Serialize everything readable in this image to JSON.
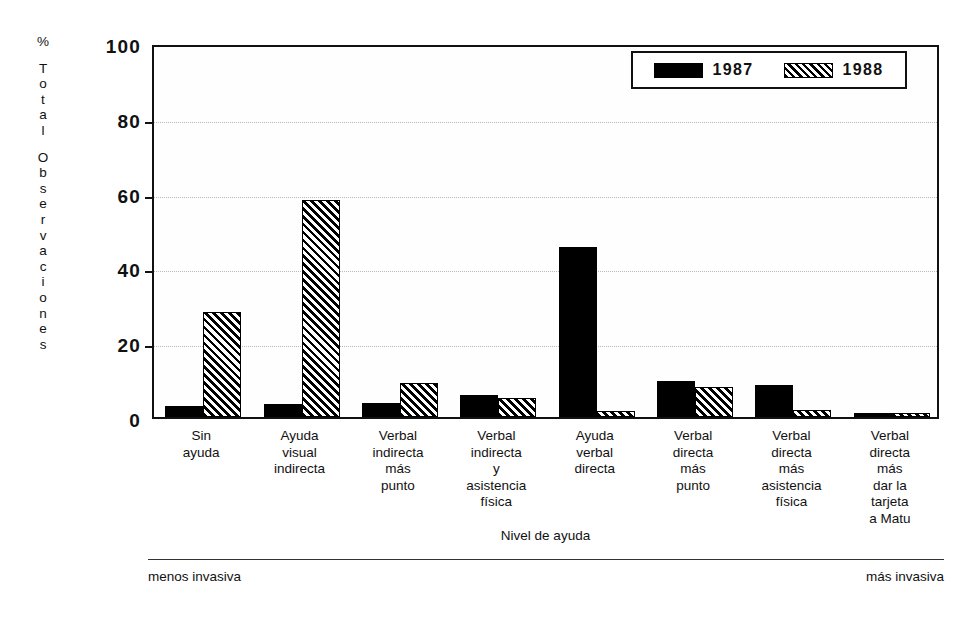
{
  "chart_data": {
    "type": "bar",
    "title": "",
    "xlabel": "Nivel de ayuda",
    "ylabel": "% Total Observaciones",
    "ylim": [
      0,
      100
    ],
    "yticks": [
      0,
      20,
      40,
      60,
      80,
      100
    ],
    "ytick_labels": [
      "0",
      "20",
      "40",
      "60",
      "80",
      "100"
    ],
    "grid": true,
    "legend_position": "top-right",
    "categories": [
      "Sin ayuda",
      "Ayuda visual indirecta",
      "Verbal indirecta más punto",
      "Verbal indirecta y asistencia física",
      "Ayuda verbal directa",
      "Verbal directa más punto",
      "Verbal directa más asistencia física",
      "Verbal directa más dar la tarjeta a Matu"
    ],
    "category_lines": [
      [
        "Sin",
        "ayuda"
      ],
      [
        "Ayuda",
        "visual",
        "indirecta"
      ],
      [
        "Verbal",
        "indirecta",
        "más",
        "punto"
      ],
      [
        "Verbal",
        "indirecta",
        "y",
        "asistencia",
        "física"
      ],
      [
        "Ayuda",
        "verbal",
        "directa"
      ],
      [
        "Verbal",
        "directa",
        "más",
        "punto"
      ],
      [
        "Verbal",
        "directa",
        "más",
        "asistencia",
        "física"
      ],
      [
        "Verbal",
        "directa",
        "más",
        "dar la",
        "tarjeta",
        "a Matu"
      ]
    ],
    "series": [
      {
        "name": "1987",
        "values": [
          3,
          3.5,
          3.8,
          6,
          45.5,
          9.5,
          8.5,
          1
        ]
      },
      {
        "name": "1988",
        "values": [
          28,
          58,
          9,
          5,
          1.5,
          8,
          2,
          1
        ]
      }
    ],
    "annotations": {
      "scale_left": "menos invasiva",
      "scale_right": "más invasiva"
    }
  },
  "legend": {
    "entries": [
      {
        "label": "1987",
        "style": "solid-black"
      },
      {
        "label": "1988",
        "style": "diagonal-hatch"
      }
    ]
  },
  "axis_title_vertical_chars": [
    "%",
    "GAP",
    "T",
    "o",
    "t",
    "a",
    "l",
    "GAP",
    "O",
    "b",
    "s",
    "e",
    "r",
    "v",
    "a",
    "c",
    "i",
    "o",
    "n",
    "e",
    "s"
  ],
  "colors": {
    "series_1987": "#000000",
    "series_1988_stroke": "#000000",
    "axis": "#111111",
    "grid": "#b9b9b9",
    "background": "#ffffff"
  }
}
